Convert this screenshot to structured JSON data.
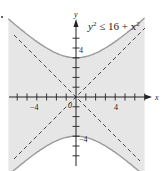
{
  "chart_data": {
    "type": "region",
    "xlabel": "x",
    "ylabel": "y",
    "xlim": [
      -7,
      7
    ],
    "ylim": [
      -7,
      8
    ],
    "x_ticks": [
      -6,
      -5,
      -4,
      -3,
      -2,
      -1,
      1,
      2,
      3,
      4,
      5,
      6,
      7
    ],
    "y_ticks": [
      -6,
      -5,
      -4,
      -3,
      -2,
      -1,
      1,
      2,
      3,
      4,
      5,
      6
    ],
    "tick_labels": {
      "x": [
        "-4",
        "4"
      ],
      "y": [
        "4",
        "-4"
      ],
      "origin": "0"
    },
    "grid": false,
    "boundary": {
      "equation": "y^2 = 16 + x^2",
      "style": "solid",
      "branches": [
        "upper",
        "lower"
      ],
      "vertices": [
        [
          0,
          4
        ],
        [
          0,
          -4
        ]
      ]
    },
    "asymptotes": [
      {
        "equation": "y = x",
        "style": "dashed"
      },
      {
        "equation": "y = -x",
        "style": "dashed"
      }
    ],
    "shaded_region": "between branches (inclusive)",
    "colors": {
      "shade": "#e6e6e6",
      "curve": "#9a9a9a",
      "axis": "#222222",
      "asymptote": "#333333"
    }
  },
  "labels": {
    "inequality_base": "y",
    "inequality_rest": " ≤ 16 + x",
    "sup": "2",
    "x_axis": "x",
    "y_axis": "y",
    "origin": "0",
    "x_neg4": "−4",
    "x_pos4": "4",
    "y_pos4": "4",
    "y_neg4": "−4"
  }
}
